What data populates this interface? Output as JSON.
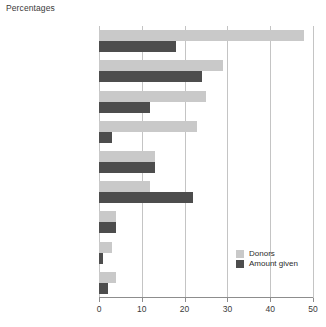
{
  "chart_data": {
    "type": "bar",
    "orientation": "horizontal",
    "title": "Percentages",
    "xlabel": "",
    "ylabel": "",
    "xlim": [
      0,
      50
    ],
    "xticks": [
      0,
      10,
      20,
      30,
      40,
      50
    ],
    "grid": true,
    "legend_position": "inside-right-lower",
    "footnote_marker": "1",
    "categories": [
      "Cash gift",
      "Direct debit",
      "Buying goods",
      "Raffle or lottery ticket",
      "Fundraising events",
      "Credit/debit card/cheque",
      "Fees",
      "Payroll giving",
      "Other methods"
    ],
    "series": [
      {
        "name": "Donors",
        "color": "#c9c9c9",
        "values": [
          48,
          29,
          25,
          23,
          13,
          12,
          4,
          3,
          4
        ]
      },
      {
        "name": "Amount given",
        "color": "#4d4d4d",
        "values": [
          18,
          24,
          12,
          3,
          13,
          22,
          4,
          1,
          2
        ]
      }
    ]
  },
  "colors": {
    "donors": "#c9c9c9",
    "amount_given": "#4d4d4d",
    "gridline": "#c4c4c4",
    "axis": "#8d8d8d",
    "text": "#2b2b2b",
    "background": "#ffffff"
  }
}
